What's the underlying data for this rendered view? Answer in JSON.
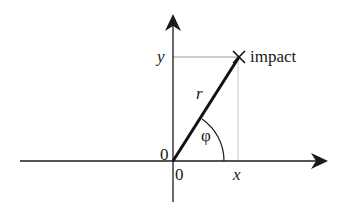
{
  "diagram": {
    "type": "polar-coordinates",
    "labels": {
      "y_axis_value": "y",
      "x_axis_value": "x",
      "origin_vertical": "0",
      "origin_horizontal": "0",
      "radius": "r",
      "angle": "φ",
      "point": "impact"
    },
    "colors": {
      "axis": "#1a1a1a",
      "vector": "#111111",
      "projection": "#aaaaaa",
      "background": "#ffffff"
    }
  }
}
